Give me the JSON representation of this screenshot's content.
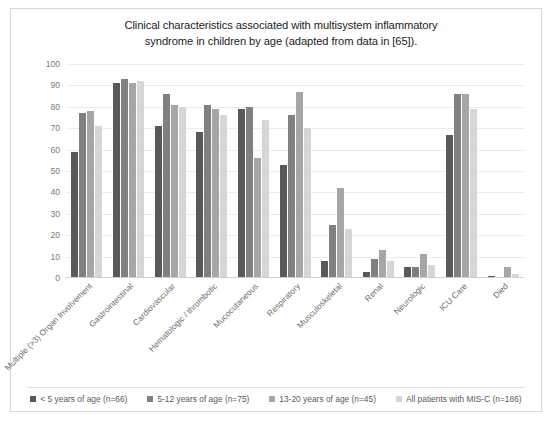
{
  "chart_data": {
    "type": "bar",
    "title": "Clinical characteristics associated with multisystem inflammatory syndrome in children by age (adapted from data in [65]).",
    "title_line1": "Clinical characteristics associated with multisystem inflammatory",
    "title_line2": "syndrome in children by age (adapted from data in [65]).",
    "xlabel": "",
    "ylabel": "",
    "ylim": [
      0,
      100
    ],
    "ytick_step": 10,
    "yticks": [
      0,
      10,
      20,
      30,
      40,
      50,
      60,
      70,
      80,
      90,
      100
    ],
    "grid": true,
    "legend_position": "bottom",
    "categories": [
      "Multiple (>3) Organ Involvement",
      "Gastrointestinal",
      "Cardiovascular",
      "Hematologic / thrombotic",
      "Mucocutaneous",
      "Respiratory",
      "Musculoskeletal",
      "Renal",
      "Neurologic",
      "ICU Care",
      "Died"
    ],
    "series": [
      {
        "name": "< 5 years of age (n=66)",
        "color": "#595959",
        "values": [
          59,
          91,
          71,
          68,
          79,
          53,
          8,
          3,
          5,
          67,
          1
        ]
      },
      {
        "name": "5-12 years of age (n=75)",
        "color": "#808080",
        "values": [
          77,
          93,
          86,
          81,
          80,
          76,
          25,
          9,
          5,
          86,
          0
        ]
      },
      {
        "name": "13-20 years of age (n=45)",
        "color": "#a6a6a6",
        "values": [
          78,
          91,
          81,
          79,
          56,
          87,
          42,
          13,
          11,
          86,
          5
        ]
      },
      {
        "name": "All patients with MIS-C (n=186)",
        "color": "#d6d6d6",
        "values": [
          71,
          92,
          80,
          76,
          74,
          70,
          23,
          8,
          6,
          79,
          2
        ]
      }
    ]
  }
}
